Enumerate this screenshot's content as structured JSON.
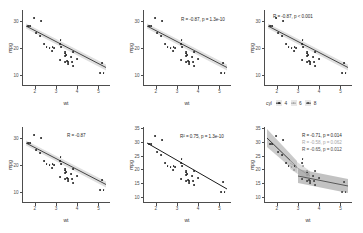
{
  "figure": {
    "kind": "ggplot2-scatter-grid",
    "rows": 2,
    "cols": 3,
    "dataset_note": "mpg vs wt"
  },
  "axes": {
    "xlabel": "wt",
    "ylabel": "mpg",
    "xticks": [
      "2",
      "3",
      "4",
      "5"
    ],
    "xtick_values": [
      2,
      3,
      4,
      5
    ],
    "xlim": [
      1.4,
      5.55
    ],
    "yticks_coarse": [
      "10",
      "20",
      "30"
    ],
    "ytick_values_coarse": [
      10,
      20,
      30
    ],
    "yticks_fine": [
      "10",
      "15",
      "20",
      "25",
      "30",
      "35"
    ],
    "ytick_values_fine": [
      10,
      15,
      20,
      25,
      30,
      35
    ],
    "ylim_coarse": [
      7.5,
      35.5
    ],
    "ylim_fine": [
      8.5,
      36
    ]
  },
  "colors": {
    "point": "#1a1a1a",
    "line": "#333333",
    "ribbon": "#d9d9d9",
    "axis": "#4d4d4d",
    "text": "#2b2b2b",
    "group_4": "#2b2b2b",
    "group_6": "#a6a6a6",
    "group_8": "#4d4d4d",
    "background": "#ffffff"
  },
  "legend": {
    "title": "cyl",
    "items": [
      {
        "label": "4",
        "color": "#2b2b2b"
      },
      {
        "label": "6",
        "color": "#a6a6a6"
      },
      {
        "label": "8",
        "color": "#4d4d4d"
      }
    ]
  },
  "panels": [
    {
      "id": "panel-1",
      "position": "top-left",
      "annotations": [],
      "ytick_mode": "coarse",
      "has_ribbon": true,
      "has_legend": false
    },
    {
      "id": "panel-2",
      "position": "top-center",
      "annotations": [
        {
          "text": "R = -0.87, p = 1.3e-10",
          "group": null
        }
      ],
      "ytick_mode": "coarse",
      "has_ribbon": true,
      "has_legend": false
    },
    {
      "id": "panel-3",
      "position": "top-right",
      "annotations": [
        {
          "text": "R = -0.87, p < 0.001",
          "group": null
        }
      ],
      "ytick_mode": "coarse",
      "has_ribbon": true,
      "has_legend": true
    },
    {
      "id": "panel-4",
      "position": "bottom-left",
      "annotations": [
        {
          "text": "R = -0.87",
          "group": null
        }
      ],
      "ytick_mode": "coarse",
      "has_ribbon": true,
      "has_legend": false
    },
    {
      "id": "panel-5",
      "position": "bottom-center",
      "annotations": [
        {
          "text": "R² = 0.75, p = 1.3e-10",
          "group": null
        }
      ],
      "ytick_mode": "fine",
      "has_ribbon": false,
      "has_legend": false
    },
    {
      "id": "panel-6",
      "position": "bottom-right",
      "annotations": [
        {
          "text": "R = -0.71, p = 0.014",
          "group": "4"
        },
        {
          "text": "R = -0.58, p = 0.062",
          "group": "6"
        },
        {
          "text": "R = -0.65, p = 0.012",
          "group": "8"
        }
      ],
      "ytick_mode": "fine",
      "has_ribbon": true,
      "has_legend": false
    }
  ],
  "chart_data": {
    "type": "scatter",
    "title": "",
    "xlabel": "wt",
    "ylabel": "mpg",
    "xlim": [
      1.4,
      5.55
    ],
    "ylim": [
      7.5,
      35.5
    ],
    "grid": false,
    "legend_position": "bottom",
    "regression": {
      "slope": -5.344,
      "intercept": 37.285,
      "r": -0.8677,
      "r_squared": 0.7528,
      "p_value": "1.3e-10"
    },
    "group_regressions": [
      {
        "group": "4",
        "r": -0.71,
        "p": "0.014",
        "color": "#2b2b2b"
      },
      {
        "group": "6",
        "r": -0.58,
        "p": "0.062",
        "color": "#a6a6a6"
      },
      {
        "group": "8",
        "r": -0.65,
        "p": "0.012",
        "color": "#4d4d4d"
      }
    ],
    "points": [
      {
        "x": 2.62,
        "y": 21.0,
        "cyl": 6
      },
      {
        "x": 2.875,
        "y": 21.0,
        "cyl": 6
      },
      {
        "x": 2.32,
        "y": 22.8,
        "cyl": 4
      },
      {
        "x": 3.215,
        "y": 21.4,
        "cyl": 6
      },
      {
        "x": 3.44,
        "y": 18.7,
        "cyl": 8
      },
      {
        "x": 3.46,
        "y": 18.1,
        "cyl": 6
      },
      {
        "x": 3.57,
        "y": 14.3,
        "cyl": 8
      },
      {
        "x": 3.19,
        "y": 24.4,
        "cyl": 4
      },
      {
        "x": 3.15,
        "y": 22.8,
        "cyl": 4
      },
      {
        "x": 3.44,
        "y": 19.2,
        "cyl": 6
      },
      {
        "x": 3.44,
        "y": 17.8,
        "cyl": 6
      },
      {
        "x": 4.07,
        "y": 16.4,
        "cyl": 8
      },
      {
        "x": 3.73,
        "y": 17.3,
        "cyl": 8
      },
      {
        "x": 3.78,
        "y": 15.2,
        "cyl": 8
      },
      {
        "x": 5.25,
        "y": 10.4,
        "cyl": 8
      },
      {
        "x": 5.424,
        "y": 10.4,
        "cyl": 8
      },
      {
        "x": 5.345,
        "y": 14.7,
        "cyl": 8
      },
      {
        "x": 2.2,
        "y": 32.4,
        "cyl": 4
      },
      {
        "x": 1.615,
        "y": 30.4,
        "cyl": 4
      },
      {
        "x": 1.835,
        "y": 33.9,
        "cyl": 4
      },
      {
        "x": 2.465,
        "y": 21.5,
        "cyl": 4
      },
      {
        "x": 3.52,
        "y": 15.5,
        "cyl": 8
      },
      {
        "x": 3.435,
        "y": 15.2,
        "cyl": 8
      },
      {
        "x": 3.84,
        "y": 13.3,
        "cyl": 8
      },
      {
        "x": 3.845,
        "y": 19.2,
        "cyl": 8
      },
      {
        "x": 1.935,
        "y": 27.3,
        "cyl": 4
      },
      {
        "x": 2.14,
        "y": 26.0,
        "cyl": 4
      },
      {
        "x": 1.513,
        "y": 30.4,
        "cyl": 4
      },
      {
        "x": 3.17,
        "y": 15.8,
        "cyl": 8
      },
      {
        "x": 2.77,
        "y": 19.7,
        "cyl": 6
      },
      {
        "x": 3.57,
        "y": 15.0,
        "cyl": 8
      },
      {
        "x": 2.78,
        "y": 21.4,
        "cyl": 4
      }
    ]
  }
}
